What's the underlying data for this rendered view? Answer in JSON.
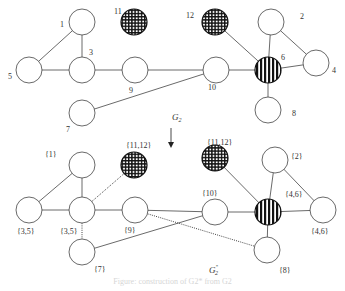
{
  "figure": {
    "caption": "Figure: construction of G2* from G2",
    "top_graph_label": "G",
    "top_graph_label_sub": "2",
    "bottom_graph_label": "G",
    "bottom_graph_label_sub": "2",
    "bottom_graph_label_sup": "*",
    "colors": {
      "stroke": "#444444",
      "fill_plain": "#ffffff",
      "fill_hatched": "#111111"
    }
  },
  "graph_top": {
    "nodes": [
      {
        "id": "1",
        "label": "1",
        "x": 82,
        "y": 22,
        "style": "plain",
        "lx": 60,
        "ly": 27
      },
      {
        "id": "11",
        "label": "11",
        "x": 134,
        "y": 22,
        "style": "grid",
        "lx": 114,
        "ly": 14
      },
      {
        "id": "12",
        "label": "12",
        "x": 215,
        "y": 22,
        "style": "grid",
        "lx": 186,
        "ly": 18
      },
      {
        "id": "2",
        "label": "2",
        "x": 271,
        "y": 22,
        "style": "plain",
        "lx": 300,
        "ly": 19
      },
      {
        "id": "5",
        "label": "5",
        "x": 29,
        "y": 70,
        "style": "plain",
        "lx": 8,
        "ly": 79
      },
      {
        "id": "3",
        "label": "3",
        "x": 82,
        "y": 70,
        "style": "plain",
        "lx": 89,
        "ly": 55
      },
      {
        "id": "9",
        "label": "9",
        "x": 135,
        "y": 70,
        "style": "plain",
        "lx": 129,
        "ly": 93
      },
      {
        "id": "10",
        "label": "10",
        "x": 216,
        "y": 70,
        "style": "plain",
        "lx": 208,
        "ly": 90
      },
      {
        "id": "6",
        "label": "6",
        "x": 268,
        "y": 70,
        "style": "stripes",
        "lx": 281,
        "ly": 60
      },
      {
        "id": "4",
        "label": "4",
        "x": 316,
        "y": 63,
        "style": "plain",
        "lx": 332,
        "ly": 73
      },
      {
        "id": "8",
        "label": "8",
        "x": 268,
        "y": 110,
        "style": "plain",
        "lx": 292,
        "ly": 116
      },
      {
        "id": "7",
        "label": "7",
        "x": 82,
        "y": 113,
        "style": "plain",
        "lx": 66,
        "ly": 132
      }
    ],
    "edges": [
      {
        "from": "1",
        "to": "5",
        "style": "solid"
      },
      {
        "from": "1",
        "to": "3",
        "style": "solid"
      },
      {
        "from": "5",
        "to": "3",
        "style": "solid"
      },
      {
        "from": "3",
        "to": "9",
        "style": "solid"
      },
      {
        "from": "9",
        "to": "10",
        "style": "solid"
      },
      {
        "from": "7",
        "to": "10",
        "style": "solid"
      },
      {
        "from": "10",
        "to": "6",
        "style": "solid"
      },
      {
        "from": "12",
        "to": "6",
        "style": "solid"
      },
      {
        "from": "2",
        "to": "6",
        "style": "solid"
      },
      {
        "from": "2",
        "to": "4",
        "style": "solid"
      },
      {
        "from": "6",
        "to": "4",
        "style": "solid"
      },
      {
        "from": "6",
        "to": "8",
        "style": "solid"
      }
    ]
  },
  "graph_bottom": {
    "nodes": [
      {
        "id": "b1",
        "label": "{1}",
        "x": 82,
        "y": 165,
        "style": "plain",
        "lx": 45,
        "ly": 157
      },
      {
        "id": "b11",
        "label": "{11,12}",
        "x": 134,
        "y": 165,
        "style": "grid",
        "lx": 126,
        "ly": 148
      },
      {
        "id": "b12",
        "label": "{11,12}",
        "x": 215,
        "y": 158,
        "style": "grid",
        "lx": 207,
        "ly": 145
      },
      {
        "id": "b2",
        "label": "{2}",
        "x": 275,
        "y": 160,
        "style": "plain",
        "lx": 291,
        "ly": 159
      },
      {
        "id": "b5",
        "label": "{3,5}",
        "x": 29,
        "y": 210,
        "style": "plain",
        "lx": 17,
        "ly": 234
      },
      {
        "id": "b3",
        "label": "{3,5}",
        "x": 82,
        "y": 210,
        "style": "plain",
        "lx": 60,
        "ly": 234
      },
      {
        "id": "b9",
        "label": "{9}",
        "x": 135,
        "y": 210,
        "style": "plain",
        "lx": 124,
        "ly": 233
      },
      {
        "id": "b10",
        "label": "{10}",
        "x": 215,
        "y": 212,
        "style": "plain",
        "lx": 202,
        "ly": 196
      },
      {
        "id": "b6",
        "label": "{4,6}",
        "x": 268,
        "y": 212,
        "style": "stripes",
        "lx": 285,
        "ly": 197
      },
      {
        "id": "b4",
        "label": "{4,6}",
        "x": 323,
        "y": 210,
        "style": "plain",
        "lx": 311,
        "ly": 234
      },
      {
        "id": "b7",
        "label": "{7}",
        "x": 82,
        "y": 252,
        "style": "plain",
        "lx": 94,
        "ly": 272
      },
      {
        "id": "b8",
        "label": "{8}",
        "x": 267,
        "y": 250,
        "style": "plain",
        "lx": 279,
        "ly": 273
      }
    ],
    "edges": [
      {
        "from": "b1",
        "to": "b5",
        "style": "solid"
      },
      {
        "from": "b1",
        "to": "b3",
        "style": "solid"
      },
      {
        "from": "b5",
        "to": "b3",
        "style": "solid"
      },
      {
        "from": "b3",
        "to": "b9",
        "style": "solid"
      },
      {
        "from": "b3",
        "to": "b11",
        "style": "dotted"
      },
      {
        "from": "b3",
        "to": "b7",
        "style": "dotted"
      },
      {
        "from": "b9",
        "to": "b10",
        "style": "solid"
      },
      {
        "from": "b7",
        "to": "b10",
        "style": "solid"
      },
      {
        "from": "b9",
        "to": "b8",
        "style": "dotted"
      },
      {
        "from": "b10",
        "to": "b6",
        "style": "solid"
      },
      {
        "from": "b12",
        "to": "b6",
        "style": "solid"
      },
      {
        "from": "b2",
        "to": "b6",
        "style": "solid"
      },
      {
        "from": "b2",
        "to": "b4",
        "style": "solid"
      },
      {
        "from": "b6",
        "to": "b4",
        "style": "solid"
      },
      {
        "from": "b6",
        "to": "b8",
        "style": "solid"
      }
    ]
  }
}
